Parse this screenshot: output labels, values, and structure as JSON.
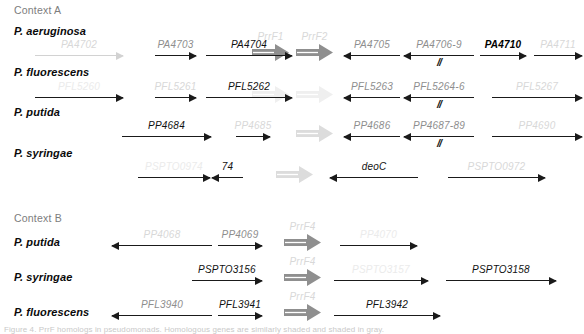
{
  "figure": {
    "sections": [
      {
        "id": "context-a",
        "title": "Context A",
        "x": 14,
        "y": 4
      },
      {
        "id": "context-b",
        "title": "Context B",
        "x": 14,
        "y": 212
      }
    ],
    "organisms": [
      {
        "id": "pa-a",
        "label": "P. aeruginosa",
        "x": 14,
        "y": 25
      },
      {
        "id": "pf-a",
        "label": "P. fluorescens",
        "x": 14,
        "y": 66
      },
      {
        "id": "pp-a",
        "label": "P. putida",
        "x": 14,
        "y": 106
      },
      {
        "id": "ps-a",
        "label": "P. syringae",
        "x": 14,
        "y": 147
      },
      {
        "id": "pp-b",
        "label": "P. putida",
        "x": 14,
        "y": 236
      },
      {
        "id": "ps-b",
        "label": "P. syringae",
        "x": 14,
        "y": 271
      },
      {
        "id": "pf-b",
        "label": "P. fluorescens",
        "x": 14,
        "y": 306
      }
    ],
    "rows": [
      {
        "id": "row-pa-context-a",
        "organism": "P. aeruginosa",
        "baseline": 56,
        "genes": [
          {
            "name": "PA4702",
            "x1": 35,
            "x2": 123,
            "dir": "right",
            "tone": "faint",
            "label_tone": "faint"
          },
          {
            "name": "PA4703",
            "x1": 155,
            "x2": 196,
            "dir": "right",
            "tone": "dark",
            "label_tone": "mid"
          },
          {
            "name": "PA4704",
            "x1": 206,
            "x2": 292,
            "dir": "right",
            "tone": "dark",
            "label_tone": "dark"
          },
          {
            "name": "PA4705",
            "x1": 344,
            "x2": 400,
            "dir": "left",
            "tone": "dark",
            "label_tone": "mid"
          },
          {
            "name": "PA4706-9",
            "x1": 404,
            "x2": 474,
            "dir": "left",
            "tone": "dark",
            "label_tone": "mid",
            "break": true
          },
          {
            "name": "PA4710",
            "x1": 480,
            "x2": 526,
            "dir": "right",
            "tone": "dark",
            "label_tone": "bold"
          },
          {
            "name": "PA4711",
            "x1": 534,
            "x2": 582,
            "dir": "right",
            "tone": "dark",
            "label_tone": "faint"
          }
        ],
        "block_arrows": [
          {
            "name": "PrrF1",
            "x": 252,
            "y": 44,
            "w": 37,
            "tone": "solid"
          },
          {
            "name": "PrrF2",
            "x": 296,
            "y": 44,
            "w": 37,
            "tone": "solid"
          }
        ]
      },
      {
        "id": "row-pf-context-a",
        "organism": "P. fluorescens",
        "baseline": 98,
        "genes": [
          {
            "name": "PFL5260",
            "x1": 35,
            "x2": 123,
            "dir": "right",
            "tone": "dark",
            "label_tone": "ghost"
          },
          {
            "name": "PFL5261",
            "x1": 155,
            "x2": 196,
            "dir": "right",
            "tone": "dark",
            "label_tone": "faint"
          },
          {
            "name": "PFL5262",
            "x1": 206,
            "x2": 292,
            "dir": "right",
            "tone": "dark",
            "label_tone": "dark"
          },
          {
            "name": "PFL5263",
            "x1": 344,
            "x2": 400,
            "dir": "left",
            "tone": "dark",
            "label_tone": "mid"
          },
          {
            "name": "PFL5264-6",
            "x1": 404,
            "x2": 474,
            "dir": "left",
            "tone": "dark",
            "label_tone": "mid",
            "break": true
          },
          {
            "name": "PFL5267",
            "x1": 492,
            "x2": 582,
            "dir": "right",
            "tone": "dark",
            "label_tone": "faint"
          }
        ],
        "block_arrows": [
          {
            "name": "",
            "x": 252,
            "y": 86,
            "w": 37,
            "tone": "ghost"
          },
          {
            "name": "",
            "x": 296,
            "y": 86,
            "w": 37,
            "tone": "ghost"
          }
        ]
      },
      {
        "id": "row-pp-context-a",
        "organism": "P. putida",
        "baseline": 137,
        "genes": [
          {
            "name": "PP4684",
            "x1": 122,
            "x2": 211,
            "dir": "right",
            "tone": "dark",
            "label_tone": "dark"
          },
          {
            "name": "PP4685",
            "x1": 236,
            "x2": 270,
            "dir": "right",
            "tone": "dark",
            "label_tone": "faint"
          },
          {
            "name": "PP4686",
            "x1": 344,
            "x2": 400,
            "dir": "left",
            "tone": "dark",
            "label_tone": "mid"
          },
          {
            "name": "PP4687-89",
            "x1": 404,
            "x2": 474,
            "dir": "left",
            "tone": "dark",
            "label_tone": "mid",
            "break": true
          },
          {
            "name": "PP4690",
            "x1": 492,
            "x2": 582,
            "dir": "right",
            "tone": "dark",
            "label_tone": "faint"
          }
        ],
        "block_arrows": [
          {
            "name": "",
            "x": 296,
            "y": 125,
            "w": 37,
            "tone": "faint"
          }
        ]
      },
      {
        "id": "row-ps-context-a",
        "organism": "P. syringae",
        "baseline": 178,
        "genes": [
          {
            "name": "PSPTO0974",
            "x1": 138,
            "x2": 210,
            "dir": "right",
            "tone": "dark",
            "label_tone": "ghost"
          },
          {
            "name": "74",
            "x1": 212,
            "x2": 243,
            "dir": "left",
            "tone": "dark",
            "label_tone": "dark"
          },
          {
            "name": "deoC",
            "x1": 330,
            "x2": 418,
            "dir": "left",
            "tone": "dark",
            "label_tone": "dark"
          },
          {
            "name": "PSPTO0972",
            "x1": 448,
            "x2": 545,
            "dir": "right",
            "tone": "dark",
            "label_tone": "faint"
          }
        ],
        "block_arrows": [
          {
            "name": "",
            "x": 276,
            "y": 166,
            "w": 37,
            "tone": "faint"
          }
        ]
      },
      {
        "id": "row-pp-context-b",
        "organism": "P. putida",
        "baseline": 246,
        "genes": [
          {
            "name": "PP4068",
            "x1": 112,
            "x2": 212,
            "dir": "left",
            "tone": "dark",
            "label_tone": "faint"
          },
          {
            "name": "PP4069",
            "x1": 218,
            "x2": 262,
            "dir": "right",
            "tone": "dark",
            "label_tone": "mid"
          },
          {
            "name": "PP4070",
            "x1": 340,
            "x2": 417,
            "dir": "right",
            "tone": "dark",
            "label_tone": "ghost"
          }
        ],
        "block_arrows": [
          {
            "name": "PrrF4",
            "x": 284,
            "y": 234,
            "w": 37,
            "tone": "solid"
          }
        ]
      },
      {
        "id": "row-ps-context-b",
        "organism": "P. syringae",
        "baseline": 281,
        "genes": [
          {
            "name": "PSPTO3156",
            "x1": 192,
            "x2": 262,
            "dir": "right",
            "tone": "dark",
            "label_tone": "dark"
          },
          {
            "name": "PSPTO3157",
            "x1": 334,
            "x2": 428,
            "dir": "right",
            "tone": "dark",
            "label_tone": "ghost"
          },
          {
            "name": "PSPTO3158",
            "x1": 446,
            "x2": 556,
            "dir": "right",
            "tone": "dark",
            "label_tone": "dark"
          }
        ],
        "block_arrows": [
          {
            "name": "PrrF4",
            "x": 284,
            "y": 269,
            "w": 37,
            "tone": "solid"
          }
        ]
      },
      {
        "id": "row-pf-context-b",
        "organism": "P. fluorescens",
        "baseline": 316,
        "genes": [
          {
            "name": "PFL3940",
            "x1": 112,
            "x2": 212,
            "dir": "left",
            "tone": "dark",
            "label_tone": "mid"
          },
          {
            "name": "PFL3941",
            "x1": 218,
            "x2": 262,
            "dir": "right",
            "tone": "dark",
            "label_tone": "dark"
          },
          {
            "name": "PFL3942",
            "x1": 334,
            "x2": 440,
            "dir": "right",
            "tone": "dark",
            "label_tone": "dark"
          }
        ],
        "block_arrows": [
          {
            "name": "PrrF4",
            "x": 284,
            "y": 304,
            "w": 37,
            "tone": "solid"
          }
        ]
      }
    ],
    "caption": {
      "text": "Figure 4. PrrF homologs in pseudomonads. Homologous genes are similarly shaded and shaded in gray.",
      "x": 4,
      "y": 325
    }
  }
}
